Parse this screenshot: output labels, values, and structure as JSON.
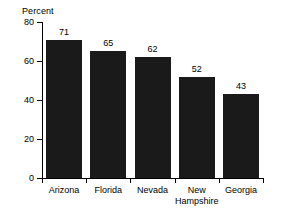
{
  "chart_data": {
    "type": "bar",
    "title": "",
    "subtitle": "",
    "xlabel": "",
    "ylabel": "Percent",
    "categories": [
      "Arizona",
      "Florida",
      "Nevada",
      "New Hampshire",
      "Georgia"
    ],
    "category_lines": [
      [
        "Arizona"
      ],
      [
        "Florida"
      ],
      [
        "Nevada"
      ],
      [
        "New",
        "Hampshire"
      ],
      [
        "Georgia"
      ]
    ],
    "values": [
      71,
      65,
      62,
      52,
      43
    ],
    "value_labels": [
      "71",
      "65",
      "62",
      "52",
      "43"
    ],
    "ylim": [
      0,
      80
    ],
    "ytick_values": [
      0,
      20,
      40,
      60,
      80
    ],
    "ytick_labels": [
      "0",
      "20",
      "40",
      "60",
      "80"
    ],
    "grid": false,
    "legend": false,
    "legend_position": "none",
    "bar_color": "#1a1a1a",
    "background_color": "#ffffff",
    "axis_color": "#000000",
    "text_color": "#000000"
  },
  "axis": {
    "y_title": "Percent"
  }
}
